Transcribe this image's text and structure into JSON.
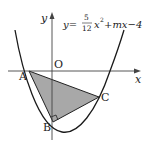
{
  "figure": {
    "equation": {
      "lhs": "y=",
      "frac_num": "5",
      "frac_den": "12",
      "rest_x": "x",
      "exponent": "2",
      "rest": "+mx−4"
    },
    "axes": {
      "x_label": "x",
      "y_label": "y",
      "origin_label": "O"
    },
    "points": [
      {
        "label": "A",
        "x": 29,
        "y": 71
      },
      {
        "label": "B",
        "x": 53,
        "y": 122
      },
      {
        "label": "C",
        "x": 99,
        "y": 97
      }
    ],
    "triangle": {
      "vertices": [
        "A",
        "B",
        "C"
      ],
      "fill": "#a8a8a8",
      "right_angle_at": "B"
    },
    "colors": {
      "curve": "#1a1a1a",
      "axis": "#333333",
      "shade": "#a8a8a8"
    }
  }
}
